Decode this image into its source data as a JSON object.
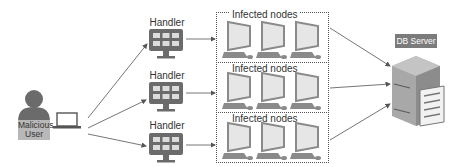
{
  "diagram": {
    "type": "botnet-ddos-architecture",
    "attacker": {
      "label": "Malicious User",
      "label_lines": [
        "Malicious",
        "User"
      ]
    },
    "handlers": [
      {
        "label": "Handler"
      },
      {
        "label": "Handler"
      },
      {
        "label": "Handler"
      }
    ],
    "groups": [
      {
        "label": "Infected nodes",
        "node_count": 3
      },
      {
        "label": "Infected nodes",
        "node_count": 3
      },
      {
        "label": "Infected nodes",
        "node_count": 3
      }
    ],
    "target": {
      "label": "DB Server"
    },
    "edges": [
      {
        "from": "attacker",
        "to": "handler-1"
      },
      {
        "from": "attacker",
        "to": "handler-2"
      },
      {
        "from": "attacker",
        "to": "handler-3"
      },
      {
        "from": "handler-1",
        "to": "group-1"
      },
      {
        "from": "handler-2",
        "to": "group-2"
      },
      {
        "from": "handler-3",
        "to": "group-3"
      },
      {
        "from": "group-1",
        "to": "target"
      },
      {
        "from": "group-2",
        "to": "target"
      },
      {
        "from": "group-3",
        "to": "target"
      }
    ],
    "colors": {
      "icon_dark": "#6b6b6b",
      "icon_light": "#e6e6e6",
      "monitor_frame": "#8a8a8a",
      "server_body": "#9a9a9a",
      "user_label_bg": "#b8b8b8",
      "db_label_bg": "#7b7b7b",
      "arrow": "#555555"
    }
  }
}
